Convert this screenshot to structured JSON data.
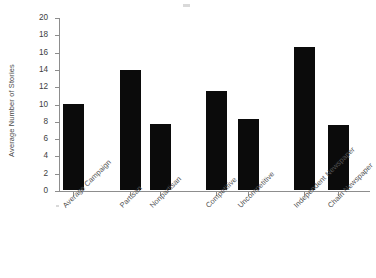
{
  "chart_data": {
    "type": "bar",
    "title": "",
    "subtitle": "",
    "xlabel": "",
    "ylabel": "Average Number of Stories",
    "ylim": [
      0,
      20
    ],
    "ytick_step": 2,
    "grid": false,
    "legend": null,
    "orientation": "vertical",
    "bar_color": "#0b0b0b",
    "categories": [
      "Average Campaign",
      "Partisan",
      "Nonpartisan",
      "Competitive",
      "Uncompetitive",
      "Independent Newspaper",
      "Chain Newspaper"
    ],
    "values": [
      9.9,
      13.9,
      7.6,
      11.4,
      8.2,
      16.5,
      7.5
    ],
    "ytick_labels": [
      "0",
      "2",
      "4",
      "6",
      "8",
      "10",
      "12",
      "14",
      "16",
      "18",
      "20"
    ],
    "group_gaps_after": [
      "Nonpartisan",
      "Uncompetitive"
    ]
  },
  "axes": {
    "y_title": "Average Number of Stories",
    "y_ticks": [
      {
        "value": 20,
        "label": "20"
      },
      {
        "value": 18,
        "label": "18"
      },
      {
        "value": 16,
        "label": "16"
      },
      {
        "value": 14,
        "label": "14"
      },
      {
        "value": 12,
        "label": "12"
      },
      {
        "value": 10,
        "label": "10"
      },
      {
        "value": 8,
        "label": "8"
      },
      {
        "value": 6,
        "label": "6"
      },
      {
        "value": 4,
        "label": "4"
      },
      {
        "value": 2,
        "label": "2"
      },
      {
        "value": 0,
        "label": "0"
      }
    ]
  },
  "bars": [
    {
      "label": "Average Campaign",
      "value": 9.9,
      "name": "bar-average-campaign"
    },
    {
      "label": "Partisan",
      "value": 13.9,
      "name": "bar-partisan"
    },
    {
      "label": "Nonpartisan",
      "value": 7.6,
      "name": "bar-nonpartisan"
    },
    {
      "label": "Competitive",
      "value": 11.4,
      "name": "bar-competitive"
    },
    {
      "label": "Uncompetitive",
      "value": 8.2,
      "name": "bar-uncompetitive"
    },
    {
      "label": "Independent Newspaper",
      "value": 16.5,
      "name": "bar-independent-newspaper"
    },
    {
      "label": "Chain Newspaper",
      "value": 7.5,
      "name": "bar-chain-newspaper"
    }
  ]
}
